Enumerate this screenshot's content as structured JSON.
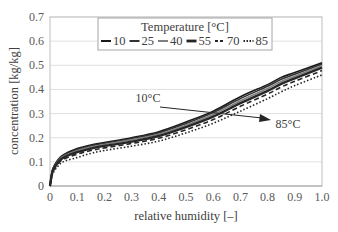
{
  "chart_data": {
    "type": "line",
    "title": "",
    "xlabel": "relative humidity [–]",
    "ylabel": "concentration [kg/kg]",
    "xlim": [
      0,
      1.0
    ],
    "ylim": [
      0,
      0.7
    ],
    "x_ticks": [
      "0",
      "0.1",
      "0.2",
      "0.3",
      "0.4",
      "0.5",
      "0.6",
      "0.7",
      "0.8",
      "0.9",
      "1.0"
    ],
    "y_ticks": [
      "0",
      "0.1",
      "0.2",
      "0.3",
      "0.4",
      "0.5",
      "0.6",
      "0.7"
    ],
    "grid": "horizontal",
    "legend": {
      "title": "Temperature [°C]",
      "position": "top-inside",
      "entries": [
        "10",
        "25",
        "40",
        "55",
        "70",
        "85"
      ]
    },
    "annotations": [
      {
        "text": "10°C",
        "x": 0.36,
        "y": 0.37
      },
      {
        "text": "85°C",
        "x": 0.87,
        "y": 0.31
      },
      {
        "type": "arrow",
        "from": [
          0.51,
          0.265
        ],
        "to": [
          0.78,
          0.275
        ],
        "note": "arrow indicating increasing temperature from 10°C to 85°C"
      }
    ],
    "x": [
      0,
      0.01,
      0.03,
      0.05,
      0.1,
      0.15,
      0.2,
      0.3,
      0.4,
      0.5,
      0.6,
      0.7,
      0.8,
      0.85,
      0.9,
      1.0
    ],
    "series": [
      {
        "name": "10",
        "style": "solid",
        "values": [
          0,
          0.07,
          0.11,
          0.13,
          0.155,
          0.17,
          0.18,
          0.2,
          0.225,
          0.265,
          0.31,
          0.37,
          0.42,
          0.45,
          0.47,
          0.51
        ]
      },
      {
        "name": "25",
        "style": "solid",
        "values": [
          0,
          0.068,
          0.107,
          0.127,
          0.151,
          0.166,
          0.177,
          0.196,
          0.22,
          0.259,
          0.304,
          0.362,
          0.413,
          0.442,
          0.463,
          0.505
        ]
      },
      {
        "name": "40",
        "style": "solid-gray",
        "values": [
          0,
          0.065,
          0.103,
          0.123,
          0.146,
          0.161,
          0.172,
          0.191,
          0.214,
          0.252,
          0.296,
          0.353,
          0.404,
          0.433,
          0.455,
          0.498
        ]
      },
      {
        "name": "55",
        "style": "solid-thick",
        "values": [
          0,
          0.062,
          0.098,
          0.118,
          0.14,
          0.155,
          0.166,
          0.184,
          0.207,
          0.244,
          0.287,
          0.343,
          0.394,
          0.423,
          0.446,
          0.49
        ]
      },
      {
        "name": "70",
        "style": "dashed",
        "values": [
          0,
          0.057,
          0.092,
          0.111,
          0.132,
          0.147,
          0.158,
          0.176,
          0.198,
          0.233,
          0.275,
          0.33,
          0.381,
          0.41,
          0.434,
          0.478
        ]
      },
      {
        "name": "85",
        "style": "dotted",
        "values": [
          0,
          0.05,
          0.083,
          0.101,
          0.118,
          0.135,
          0.147,
          0.165,
          0.186,
          0.22,
          0.26,
          0.31,
          0.362,
          0.39,
          0.416,
          0.46
        ]
      }
    ]
  }
}
